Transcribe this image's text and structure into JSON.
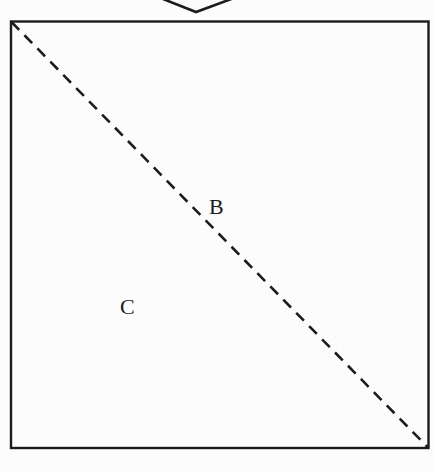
{
  "figure": {
    "background_color": "#fcfcfc",
    "line_color": "#1c1c1c",
    "icons": {
      "top": "chevron-down-icon"
    },
    "labels": {
      "b": "B",
      "c": "C"
    }
  }
}
